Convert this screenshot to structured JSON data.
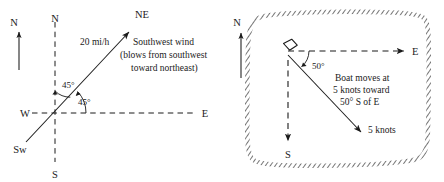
{
  "figure": {
    "background_color": "#ffffff",
    "ink_color": "#1a1a1a"
  },
  "left_diagram": {
    "name": "southwest-wind-vector-diagram",
    "compass_reference": {
      "label": "N",
      "icon": "north-arrow-icon"
    },
    "axis_labels": {
      "north": "N",
      "south": "S",
      "east": "E",
      "west": "W"
    },
    "vector": {
      "tip_label": "NE",
      "tail_label": "Sw",
      "magnitude_label": "20 mi/h",
      "direction_degrees": 45
    },
    "angles": [
      {
        "value": "45°",
        "from": "north-axis"
      },
      {
        "value": "45°",
        "from": "east-axis"
      }
    ],
    "caption_lines": [
      "Southwest wind",
      "(blows from southwest",
      "toward northeast)"
    ]
  },
  "right_diagram": {
    "name": "boat-on-island-diagram",
    "compass_reference": {
      "label": "N",
      "icon": "north-arrow-icon"
    },
    "island": {
      "name": "island-outline",
      "fill": "#ffffff",
      "hatch_color": "#6f6f6f"
    },
    "axis_labels": {
      "east": "E",
      "south": "S"
    },
    "boat": {
      "icon": "boat-hull-icon"
    },
    "angles": [
      {
        "value": "50°",
        "from": "east-axis"
      }
    ],
    "vector": {
      "magnitude_label": "5 knots",
      "direction_degrees": -50
    },
    "caption_lines": [
      "Boat moves at",
      "5 knots toward",
      "50° S of E"
    ]
  }
}
